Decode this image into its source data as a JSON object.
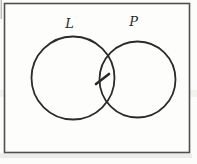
{
  "diagram": {
    "type": "venn",
    "sets": [
      {
        "label": "L",
        "position": "left"
      },
      {
        "label": "P",
        "position": "right"
      }
    ],
    "intersection": {
      "mark": "diagonal-dash"
    },
    "colors": {
      "line": "#2b2b2b",
      "frame": "#4f4f4f",
      "fill": "#fdfdfc",
      "artifact": "#e9e9e3"
    }
  }
}
